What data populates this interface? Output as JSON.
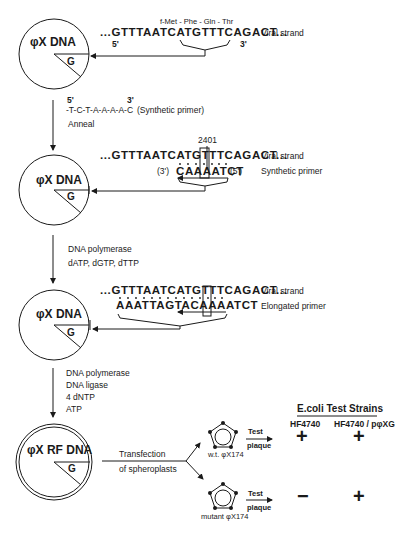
{
  "step1": {
    "circle_label": "φX DNA",
    "region": "G",
    "codons": "f-Met - Phe - Gln - Thr",
    "sequence": "...GTTTAATCATGTTTCAGACT...",
    "five_prime": "5'",
    "three_prime": "3'",
    "strand_label": "Viral strand"
  },
  "primer": {
    "five_prime": "5'",
    "three_prime": "3'",
    "sequence": "-T-C-T-A-A-A-A-C",
    "label": "(Synthetic primer)",
    "action": "Anneal"
  },
  "step2": {
    "circle_label": "φX DNA",
    "region": "G",
    "position": "2401",
    "viral_sequence": "...GTTTAATCATGTTTCAGACT...",
    "viral_label": "Viral strand",
    "primer_left": "(3')",
    "primer_sequence": "CAAAATCT",
    "primer_right": "(5')",
    "primer_label": "Synthetic primer"
  },
  "reagents1": [
    "DNA polymerase",
    "dATP, dGTP, dTTP"
  ],
  "step3": {
    "circle_label": "φX DNA",
    "region": "G",
    "viral_sequence": "...GTTTAATCATGTTTCAGACT...",
    "viral_label": "Viral strand",
    "elongated_sequence": "AAATTAGTACAAAATCT",
    "elongated_label": "Elongated primer"
  },
  "reagents2": [
    "DNA polymerase",
    "DNA ligase",
    "4 dNTP",
    "ATP"
  ],
  "step4": {
    "circle_label": "φX RF DNA",
    "region": "G",
    "transfection": [
      "Transfection",
      "of spheroplasts"
    ]
  },
  "results": {
    "title": "E.coli  Test Strains",
    "columns": [
      "HF4740",
      "HF4740 / pφXG"
    ],
    "rows": [
      {
        "phage": "w.t. φX174",
        "test": [
          "Test",
          "plaque"
        ],
        "values": [
          "+",
          "+"
        ]
      },
      {
        "phage": "mutant φX174",
        "test": [
          "Test",
          "plaque"
        ],
        "values": [
          "−",
          "+"
        ]
      }
    ]
  }
}
